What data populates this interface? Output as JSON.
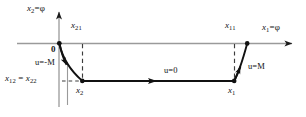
{
  "figure": {
    "kind": "phase-plane-bang-bang-control-diagram",
    "background_color": "#ffffff",
    "axis_color": "#8c8c8c",
    "curve_color": "#111111",
    "dash_color": "#4a4a4a",
    "labels": {
      "y_axis": "x2=φ",
      "x_axis": "x1=φ",
      "origin": "0",
      "x21": "x21",
      "x11": "x11",
      "x2": "x2",
      "x1": "x1",
      "x12_x22": "x12 = x22",
      "u_neg_M": "u=-M",
      "u_zero": "u=0",
      "u_pos_M": "u=M"
    },
    "label_parts": {
      "y_axis": {
        "base": "x",
        "sub": "2",
        "tail": "=φ"
      },
      "x_axis": {
        "base": "x",
        "sub": "1",
        "tail": "=φ"
      },
      "x21": {
        "base": "x",
        "sub": "21"
      },
      "x11": {
        "base": "x",
        "sub": "11"
      },
      "x2": {
        "base": "x",
        "sub": "2"
      },
      "x1": {
        "base": "x",
        "sub": "1"
      },
      "x12": {
        "base": "x",
        "sub": "12"
      },
      "x22": {
        "base": "x",
        "sub": "22"
      },
      "eq": " = "
    },
    "segments": [
      {
        "name": "u-equals-minus-M-arc",
        "label": "u=-M",
        "from": "origin",
        "to": "x2",
        "direction": "downward"
      },
      {
        "name": "u-equals-zero-line",
        "label": "u=0",
        "from": "x1",
        "to": "x2",
        "direction": "leftward"
      },
      {
        "name": "u-equals-plus-M-arc",
        "label": "u=M",
        "from": "x1",
        "to": "x11",
        "direction": "upward"
      }
    ],
    "markers": [
      {
        "name": "origin-dot",
        "x": 59,
        "y": 43
      },
      {
        "name": "x2-dot",
        "x": 82,
        "y": 81
      },
      {
        "name": "x1-dot",
        "x": 234,
        "y": 81
      },
      {
        "name": "x11-dot",
        "x": 247,
        "y": 43
      }
    ]
  }
}
